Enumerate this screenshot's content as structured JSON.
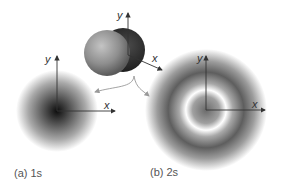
{
  "diagram": {
    "panels": [
      {
        "id": "a",
        "caption": "(a) 1s",
        "axes": {
          "x": "x",
          "y": "y"
        }
      },
      {
        "id": "b",
        "caption": "(b) 2s",
        "axes": {
          "x": "x",
          "y": "y"
        }
      }
    ],
    "sphere_axes": {
      "x": "x",
      "y": "y"
    },
    "colors": {
      "dark": "#111111",
      "mid": "#8a8a8a",
      "light": "#ffffff",
      "axis": "#333333"
    }
  }
}
